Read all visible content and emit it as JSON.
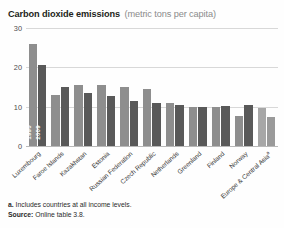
{
  "title": {
    "main": "Carbon dioxide emissions",
    "sub": "(metric tons per capita)"
  },
  "series_labels": {
    "s1990": "1990",
    "s2009": "2009"
  },
  "footnotes": {
    "note_marker": "a.",
    "note_text": " Includes countries at all income levels.",
    "source_label": "Source:",
    "source_text": " Online table 3.8."
  },
  "colors": {
    "bar_1990": "#8e8e8e",
    "bar_2009": "#595959",
    "bar_region_1990": "#a7a7a7",
    "bar_region_2009": "#9a9a9a",
    "gridline": "#d8d8d8",
    "title_sub": "#8b8b8b"
  },
  "chart_data": {
    "type": "bar",
    "title": "Carbon dioxide emissions (metric tons per capita)",
    "xlabel": "",
    "ylabel": "",
    "ylim": [
      0,
      30
    ],
    "yticks": [
      0,
      10,
      20,
      30
    ],
    "ytick_labels": [
      "0",
      "10",
      "20",
      "30"
    ],
    "grid": true,
    "legend": "in-bar labels on first group",
    "categories": [
      "Luxembourg",
      "Faroe Islands",
      "Kazakhstan",
      "Estonia",
      "Russian Federation",
      "Czech Republic",
      "Netherlands",
      "Greenland",
      "Finland",
      "Norway",
      "Europe & Central Asia"
    ],
    "category_footnote_markers": {
      "Europe & Central Asia": "a"
    },
    "series": [
      {
        "name": "1990",
        "values": [
          26.0,
          13.0,
          15.5,
          15.5,
          15.0,
          14.6,
          11.0,
          10.0,
          10.0,
          7.6,
          9.6
        ]
      },
      {
        "name": "2009",
        "values": [
          20.6,
          15.1,
          13.6,
          12.6,
          11.5,
          11.0,
          10.5,
          10.0,
          10.2,
          10.5,
          7.5
        ]
      }
    ]
  }
}
